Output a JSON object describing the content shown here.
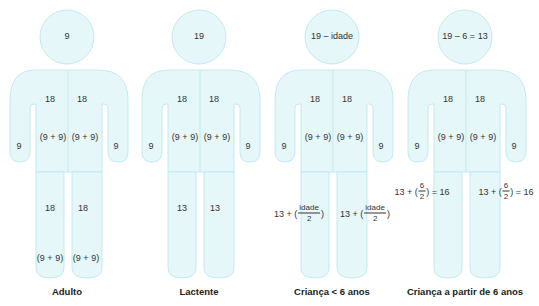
{
  "colors": {
    "fill": "#e6f7fa",
    "stroke": "#b6e6ee",
    "text": "#333333"
  },
  "figures": [
    {
      "caption": "Adulto",
      "head": "9",
      "chest_left": "18",
      "chest_right": "18",
      "trunk_left_breakdown": "(9 + 9)",
      "trunk_right_breakdown": "(9 + 9)",
      "arm_left": "9",
      "arm_right": "9",
      "leg_left": "18",
      "leg_right": "18",
      "leg_left_breakdown": "(9 + 9)",
      "leg_right_breakdown": "(9 + 9)"
    },
    {
      "caption": "Lactente",
      "head": "19",
      "chest_left": "18",
      "chest_right": "18",
      "trunk_left_breakdown": "(9 + 9)",
      "trunk_right_breakdown": "(9 + 9)",
      "arm_left": "9",
      "arm_right": "9",
      "leg_left": "13",
      "leg_right": "13"
    },
    {
      "caption": "Criança < 6 anos",
      "head": "19 – idade",
      "chest_left": "18",
      "chest_right": "18",
      "trunk_left_breakdown": "(9 + 9)",
      "trunk_right_breakdown": "(9 + 9)",
      "arm_left": "9",
      "arm_right": "9",
      "leg_formula": {
        "prefix": "13 + (",
        "numerator": "idade",
        "denominator": "2",
        "suffix": ")"
      }
    },
    {
      "caption": "Criança a partir de 6 anos",
      "head": "19 – 6 = 13",
      "chest_left": "18",
      "chest_right": "18",
      "trunk_left_breakdown": "(9 + 9)",
      "trunk_right_breakdown": "(9 + 9)",
      "arm_left": "9",
      "arm_right": "9",
      "leg_formula": {
        "prefix": "13 + (",
        "numerator": "6",
        "denominator": "2",
        "suffix": ") = 16"
      }
    }
  ]
}
